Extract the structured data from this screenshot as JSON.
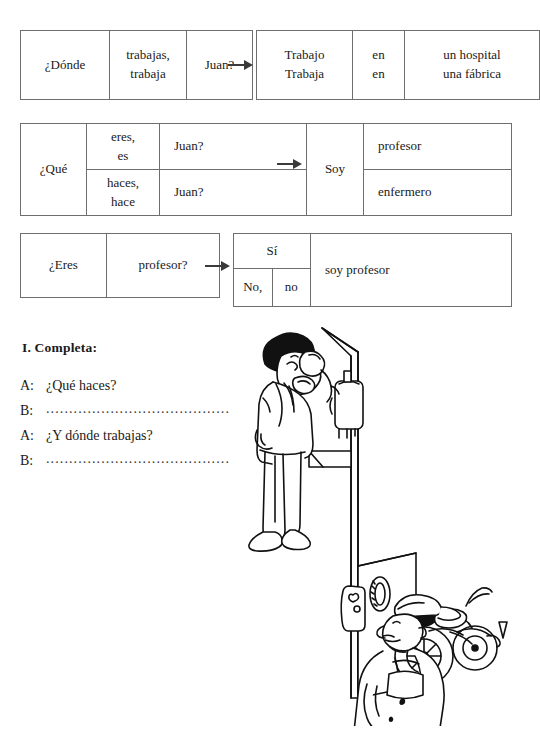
{
  "page": {
    "background": "#ffffff",
    "ink": "#1a1a1a",
    "border_color": "#6e6e6e"
  },
  "tables": [
    {
      "name": "donde-trabajas",
      "question": {
        "col1": "¿Dónde",
        "col2_line1": "trabajas,",
        "col2_line2": "trabaja",
        "col3": "Juan?"
      },
      "answer": {
        "col1_line1": "Trabajo",
        "col1_line2": "Trabaja",
        "col2_line1": "en",
        "col2_line2": "en",
        "col3_line1": "un hospital",
        "col3_line2": "una fábrica"
      }
    },
    {
      "name": "que-haces",
      "question": {
        "col1": "¿Qué",
        "row1_col2_line1": "eres,",
        "row1_col2_line2": "es",
        "row1_col3": "Juan?",
        "row2_col2_line1": "haces,",
        "row2_col2_line2": "hace",
        "row2_col3": "Juan?"
      },
      "answer": {
        "col1": "Soy",
        "row1_col2": "profesor",
        "row2_col2": "enfermero"
      }
    },
    {
      "name": "eres-profesor",
      "question": {
        "col1": "¿Eres",
        "col2": "profesor?"
      },
      "answer": {
        "row1_col1": "Sí",
        "row2_col1": "No,",
        "row2_col2": "no",
        "col3": "soy profesor"
      }
    }
  ],
  "exercise": {
    "heading": "I.  Completa:",
    "lines": [
      {
        "speaker": "A:",
        "text": "¿Qué haces?",
        "dots": ""
      },
      {
        "speaker": "B:",
        "text": "",
        "dots": "........................................"
      },
      {
        "speaker": "A:",
        "text": "¿Y dónde trabajas?",
        "dots": ""
      },
      {
        "speaker": "B:",
        "text": "",
        "dots": "........................................"
      }
    ]
  },
  "illustration": {
    "name": "cartoon-office-worker-and-mechanic",
    "description": "Line-art cartoon: a man with afro hair in a suit drinking from a cup at a water cooler above, and a mechanic in overalls with a cap holding a wrench beside a motorcycle below."
  }
}
